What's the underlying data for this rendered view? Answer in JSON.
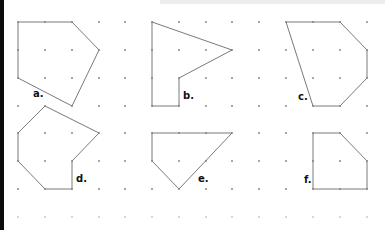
{
  "figure": {
    "grid": {
      "columns_x": [
        18,
        45,
        72,
        99,
        125,
        152,
        179,
        206,
        232,
        259,
        286,
        313,
        340,
        367
      ],
      "rows_y": [
        22,
        50,
        78,
        106,
        133,
        161,
        189,
        217
      ],
      "dot_color": "#8a8a8a",
      "faded_row_color": "#c9c9c9"
    },
    "line_color": "#7a7a7a",
    "shapes": [
      {
        "label": "a.",
        "points": [
          [
            18,
            22
          ],
          [
            45,
            22
          ],
          [
            72,
            22
          ],
          [
            99,
            50
          ],
          [
            72,
            106
          ],
          [
            18,
            78
          ],
          [
            18,
            50
          ]
        ],
        "label_pos": [
          33,
          97
        ]
      },
      {
        "label": "b.",
        "points": [
          [
            152,
            22
          ],
          [
            232,
            50
          ],
          [
            179,
            78
          ],
          [
            179,
            106
          ],
          [
            152,
            106
          ],
          [
            152,
            78
          ],
          [
            152,
            50
          ]
        ],
        "label_pos": [
          183,
          99
        ]
      },
      {
        "label": "c.",
        "points": [
          [
            286,
            22
          ],
          [
            313,
            22
          ],
          [
            340,
            22
          ],
          [
            367,
            50
          ],
          [
            367,
            78
          ],
          [
            340,
            106
          ],
          [
            313,
            106
          ],
          [
            286,
            22
          ]
        ],
        "label_pos": [
          298,
          100
        ]
      },
      {
        "label": "d.",
        "points": [
          [
            45,
            106
          ],
          [
            99,
            133
          ],
          [
            72,
            161
          ],
          [
            72,
            189
          ],
          [
            45,
            189
          ],
          [
            18,
            161
          ],
          [
            18,
            133
          ]
        ],
        "label_pos": [
          76,
          182
        ]
      },
      {
        "label": "e.",
        "points": [
          [
            152,
            133
          ],
          [
            179,
            133
          ],
          [
            206,
            133
          ],
          [
            232,
            133
          ],
          [
            179,
            189
          ],
          [
            152,
            161
          ]
        ],
        "label_pos": [
          198,
          182
        ]
      },
      {
        "label": "f.",
        "points": [
          [
            313,
            133
          ],
          [
            340,
            133
          ],
          [
            367,
            161
          ],
          [
            367,
            189
          ],
          [
            340,
            189
          ],
          [
            313,
            189
          ],
          [
            313,
            161
          ]
        ],
        "label_pos": [
          304,
          183
        ]
      }
    ]
  }
}
